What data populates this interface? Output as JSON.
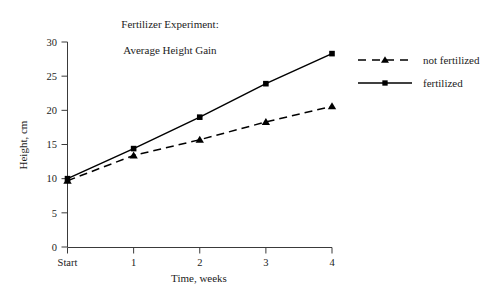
{
  "chart_data": {
    "type": "line",
    "title": "Fertilizer Experiment:\nAverage Height Gain",
    "title_line1": "Fertilizer Experiment:",
    "title_line2": "Average Height Gain",
    "xlabel": "Time, weeks",
    "ylabel": "Height, cm",
    "categories": [
      "Start",
      "1",
      "2",
      "3",
      "4"
    ],
    "x": [
      0,
      1,
      2,
      3,
      4
    ],
    "xlim": [
      0,
      4
    ],
    "ylim": [
      0,
      30
    ],
    "ytick_labels": [
      "0",
      "5",
      "10",
      "15",
      "20",
      "25",
      "30"
    ],
    "yticks": [
      0,
      5,
      10,
      15,
      20,
      25,
      30
    ],
    "grid": false,
    "legend_position": "right",
    "series": [
      {
        "name": "not fertilized",
        "marker": "triangle",
        "linestyle": "dashed",
        "color": "#000000",
        "values": [
          9.7,
          13.4,
          15.7,
          18.3,
          20.6
        ]
      },
      {
        "name": "fertilized",
        "marker": "square",
        "linestyle": "solid",
        "color": "#000000",
        "values": [
          10.0,
          14.4,
          19.0,
          23.9,
          28.3
        ]
      }
    ]
  },
  "legend": {
    "items": [
      {
        "label": "not fertilized"
      },
      {
        "label": "fertilized"
      }
    ]
  }
}
